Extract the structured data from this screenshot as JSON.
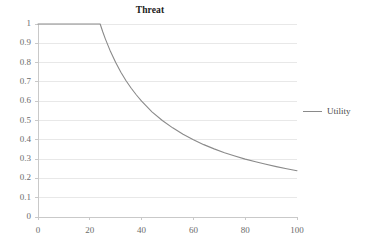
{
  "chart_data": {
    "type": "line",
    "title": "Threat",
    "xlabel": "",
    "ylabel": "",
    "xlim": [
      0,
      100
    ],
    "ylim": [
      0,
      1
    ],
    "grid": true,
    "grid_axis": "y",
    "legend_position": "right",
    "x_ticks": [
      "0",
      "20",
      "40",
      "60",
      "80",
      "100"
    ],
    "x_tick_values": [
      0,
      20,
      40,
      60,
      80,
      100
    ],
    "y_ticks": [
      "0",
      "0.1",
      "0.2",
      "0.3",
      "0.4",
      "0.5",
      "0.6",
      "0.7",
      "0.8",
      "0.9",
      "1"
    ],
    "y_tick_values": [
      0,
      0.1,
      0.2,
      0.3,
      0.4,
      0.5,
      0.6,
      0.7,
      0.8,
      0.9,
      1
    ],
    "series": [
      {
        "name": "Utility",
        "color": "#8a8a8a",
        "breakpoint_x": 24,
        "x": [
          0,
          5,
          10,
          15,
          20,
          24,
          25,
          26,
          28,
          30,
          32,
          34,
          36,
          38,
          40,
          44,
          48,
          52,
          56,
          60,
          64,
          68,
          72,
          76,
          80,
          84,
          88,
          92,
          96,
          100
        ],
        "values": [
          1,
          1,
          1,
          1,
          1,
          1,
          0.96,
          0.923,
          0.857,
          0.8,
          0.75,
          0.706,
          0.667,
          0.632,
          0.6,
          0.545,
          0.5,
          0.462,
          0.429,
          0.4,
          0.375,
          0.353,
          0.333,
          0.316,
          0.3,
          0.286,
          0.273,
          0.261,
          0.25,
          0.24
        ]
      }
    ],
    "annotations": []
  },
  "legend": {
    "entries": [
      {
        "label": "Utility"
      }
    ]
  },
  "colors": {
    "line": "#8a8a8a",
    "grid": "#e8e8e8",
    "axis": "#c9c9c9",
    "tick_text": "#6b6b6b",
    "title_text": "#1a1a1a",
    "background": "#ffffff"
  }
}
